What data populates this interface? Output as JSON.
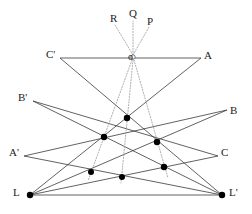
{
  "figure": {
    "name": "projective-geometry-desargues-diagram",
    "width": 252,
    "height": 214,
    "background_color": "#ffffff",
    "line_color": "#3a3a3a",
    "dotted_line_color": "#8a8a8a",
    "point_color": "#000000"
  },
  "labels": {
    "o": "o",
    "P": "P",
    "Q": "Q",
    "R": "R",
    "A": "A",
    "B": "B",
    "C": "C",
    "A_prime": "A'",
    "B_prime": "B'",
    "C_prime": "C'",
    "L": "L",
    "L_prime": "L'"
  },
  "label_positions": {
    "o": {
      "x": 130,
      "y": 52
    },
    "P": {
      "x": 148,
      "y": 17
    },
    "Q": {
      "x": 131,
      "y": 11
    },
    "R": {
      "x": 112,
      "y": 16
    },
    "A": {
      "x": 205,
      "y": 52
    },
    "B": {
      "x": 231,
      "y": 107
    },
    "C": {
      "x": 222,
      "y": 149
    },
    "A_prime": {
      "x": 10,
      "y": 149
    },
    "B_prime": {
      "x": 19,
      "y": 94
    },
    "C_prime": {
      "x": 47,
      "y": 51
    },
    "L": {
      "x": 14,
      "y": 189
    },
    "L_prime": {
      "x": 230,
      "y": 189
    }
  },
  "vertices": {
    "o": {
      "x": 133,
      "y": 57
    },
    "L": {
      "x": 30,
      "y": 195
    },
    "L_prime": {
      "x": 222,
      "y": 195
    },
    "top_center": {
      "x": 127,
      "y": 118
    },
    "left_mid": {
      "x": 104,
      "y": 137
    },
    "right_mid": {
      "x": 157,
      "y": 142
    },
    "lower_left": {
      "x": 91,
      "y": 172
    },
    "bottom_center": {
      "x": 122,
      "y": 177
    },
    "lower_right": {
      "x": 164,
      "y": 167
    }
  },
  "solid_lines": [
    {
      "name": "line-A-prime-to-B",
      "from": {
        "x": 24,
        "y": 156
      },
      "to": {
        "x": 227,
        "y": 110
      }
    },
    {
      "name": "line-B-prime-to-C",
      "from": {
        "x": 33,
        "y": 101
      },
      "to": {
        "x": 218,
        "y": 156
      }
    },
    {
      "name": "line-C-prime-to-A",
      "from": {
        "x": 60,
        "y": 58
      },
      "to": {
        "x": 201,
        "y": 58
      }
    },
    {
      "name": "line-L-to-upper-right",
      "from": {
        "x": 30,
        "y": 195
      },
      "to": {
        "x": 190,
        "y": 96
      }
    },
    {
      "name": "line-L-prime-to-upper-left",
      "from": {
        "x": 222,
        "y": 195
      },
      "to": {
        "x": 72,
        "y": 96
      }
    },
    {
      "name": "line-L-to-L-prime",
      "from": {
        "x": 30,
        "y": 195
      },
      "to": {
        "x": 222,
        "y": 195
      }
    },
    {
      "name": "line-L-to-lower-right-chord",
      "from": {
        "x": 30,
        "y": 195
      },
      "to": {
        "x": 222,
        "y": 195
      }
    },
    {
      "name": "line-L-to-bottom-center-chord",
      "from": {
        "x": 30,
        "y": 195
      },
      "to": {
        "x": 222,
        "y": 195
      }
    }
  ],
  "dotted_lines": [
    {
      "name": "dotted-o-to-R",
      "from": {
        "x": 133,
        "y": 57
      },
      "to": {
        "x": 117,
        "y": 24
      }
    },
    {
      "name": "dotted-o-to-Q",
      "from": {
        "x": 133,
        "y": 57
      },
      "to": {
        "x": 133,
        "y": 22
      }
    },
    {
      "name": "dotted-o-to-P",
      "from": {
        "x": 133,
        "y": 57
      },
      "to": {
        "x": 148,
        "y": 26
      }
    },
    {
      "name": "dotted-o-to-lower-left",
      "from": {
        "x": 133,
        "y": 57
      },
      "to": {
        "x": 91,
        "y": 172
      }
    },
    {
      "name": "dotted-o-to-bottom-center",
      "from": {
        "x": 133,
        "y": 57
      },
      "to": {
        "x": 122,
        "y": 177
      }
    },
    {
      "name": "dotted-o-to-lower-right",
      "from": {
        "x": 133,
        "y": 57
      },
      "to": {
        "x": 164,
        "y": 167
      }
    }
  ],
  "points": [
    {
      "name": "point-o",
      "x": 133,
      "y": 57,
      "radius": 2.2,
      "filled": false
    },
    {
      "name": "point-top-center",
      "x": 127,
      "y": 118,
      "radius": 3.2,
      "filled": true
    },
    {
      "name": "point-left-mid",
      "x": 104,
      "y": 137,
      "radius": 3.2,
      "filled": true
    },
    {
      "name": "point-right-mid",
      "x": 157,
      "y": 142,
      "radius": 3.2,
      "filled": true
    },
    {
      "name": "point-lower-left",
      "x": 91,
      "y": 172,
      "radius": 3.0,
      "filled": true
    },
    {
      "name": "point-bottom-center",
      "x": 122,
      "y": 177,
      "radius": 3.0,
      "filled": true
    },
    {
      "name": "point-lower-right",
      "x": 164,
      "y": 167,
      "radius": 3.2,
      "filled": true
    },
    {
      "name": "point-L",
      "x": 30,
      "y": 195,
      "radius": 3.2,
      "filled": true
    },
    {
      "name": "point-L-prime",
      "x": 222,
      "y": 195,
      "radius": 3.2,
      "filled": true
    }
  ]
}
